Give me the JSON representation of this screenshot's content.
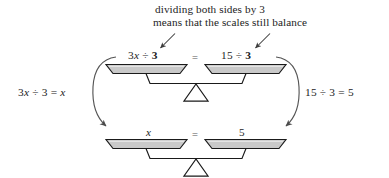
{
  "figure": {
    "caption_line1": "dividing both sides by 3",
    "caption_line2": "means that the scales still balance",
    "left_equation": "3x ÷ 3 = x",
    "right_equation": "15 ÷ 3 = 5",
    "equals_symbol": "=",
    "colors": {
      "pan_fill": "#c9c9c9",
      "pan_stroke": "#1a1a1a",
      "beam_stroke": "#1a1a1a",
      "fulcrum_fill": "#ffffff",
      "fulcrum_stroke": "#1a1a1a",
      "arrow_stroke": "#4a4a4a",
      "text": "#1d1d1d",
      "equals_gray": "#8e8e8e",
      "background": "#ffffff"
    }
  },
  "top_scale": {
    "name": "top-balance-scale",
    "left_pan_label": "3x ÷ 3",
    "left_pan_label_parts": {
      "coefficient": "3",
      "variable": "x",
      "operator": "÷",
      "divisor": "3"
    },
    "right_pan_label": "15 ÷ 3",
    "right_pan_label_parts": {
      "dividend": "15",
      "operator": "÷",
      "divisor": "3"
    },
    "equals": "="
  },
  "bottom_scale": {
    "name": "bottom-balance-scale",
    "left_pan_label": "x",
    "right_pan_label": "5",
    "equals": "="
  },
  "annotations": {
    "arrow_left_name": "caption-arrow-to-left-pan",
    "arrow_right_name": "caption-arrow-to-right-pan",
    "curve_left_name": "left-transition-curve-arrow",
    "curve_right_name": "right-transition-curve-arrow"
  }
}
